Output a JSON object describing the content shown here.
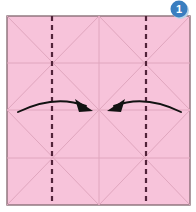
{
  "diagram": {
    "step_badge": {
      "label": "1",
      "color": "#3a7ec0",
      "shadow_color": "#b9d4e8",
      "center_x": 179,
      "center_y": 9,
      "radius": 8.5
    },
    "paper": {
      "name": "square-sheet",
      "fill_color": "#f7c3da",
      "border_color": "#8a7078",
      "x": 7,
      "y": 16,
      "width": 183,
      "height": 189
    },
    "crease_color": "#e0a6be",
    "crease_lines": [
      {
        "name": "horizontal-crease-quarter-top",
        "x1": 7,
        "y1": 63,
        "x2": 190,
        "y2": 63
      },
      {
        "name": "horizontal-crease-center",
        "x1": 7,
        "y1": 110,
        "x2": 190,
        "y2": 110
      },
      {
        "name": "horizontal-crease-quarter-bottom",
        "x1": 7,
        "y1": 158,
        "x2": 190,
        "y2": 158
      },
      {
        "name": "vertical-crease-center",
        "x1": 99,
        "y1": 16,
        "x2": 99,
        "y2": 205
      },
      {
        "name": "diagonal-tl-quadrant-down",
        "x1": 7,
        "y1": 16,
        "x2": 99,
        "y2": 110
      },
      {
        "name": "diagonal-tl-quadrant-up",
        "x1": 7,
        "y1": 110,
        "x2": 99,
        "y2": 16
      },
      {
        "name": "diagonal-tr-quadrant-down",
        "x1": 99,
        "y1": 16,
        "x2": 190,
        "y2": 110
      },
      {
        "name": "diagonal-tr-quadrant-up",
        "x1": 99,
        "y1": 110,
        "x2": 190,
        "y2": 16
      },
      {
        "name": "diagonal-bl-quadrant-down",
        "x1": 7,
        "y1": 110,
        "x2": 99,
        "y2": 205
      },
      {
        "name": "diagonal-bl-quadrant-up",
        "x1": 7,
        "y1": 205,
        "x2": 99,
        "y2": 110
      },
      {
        "name": "diagonal-br-quadrant-down",
        "x1": 99,
        "y1": 110,
        "x2": 190,
        "y2": 205
      },
      {
        "name": "diagonal-br-quadrant-up",
        "x1": 99,
        "y1": 205,
        "x2": 190,
        "y2": 110
      }
    ],
    "fold_lines": [
      {
        "name": "fold-line-left",
        "x": 52,
        "y1": 16,
        "y2": 205,
        "style": "dashed",
        "color": "#52233a"
      },
      {
        "name": "fold-line-right",
        "x": 146,
        "y1": 16,
        "y2": 205,
        "style": "dashed",
        "color": "#52233a"
      }
    ],
    "arrows": [
      {
        "name": "fold-arrow-left",
        "direction": "right",
        "color": "#1a1a1a",
        "path": "M 18 110 Q 55 95 88 107",
        "head": "92,110 78,100 80,111"
      },
      {
        "name": "fold-arrow-right",
        "direction": "left",
        "color": "#1a1a1a",
        "path": "M 180 110 Q 145 95 112 107",
        "head": "108,110 122,100 120,111"
      }
    ]
  }
}
